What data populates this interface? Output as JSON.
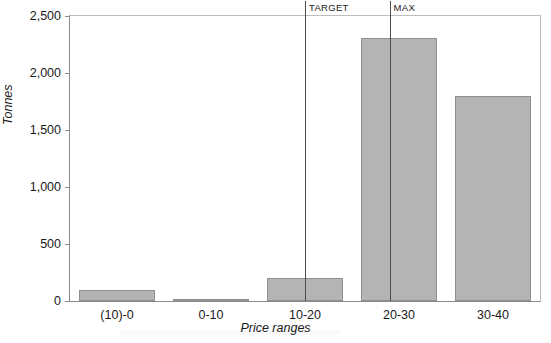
{
  "chart_data": {
    "type": "bar",
    "title": "",
    "xlabel": "Price ranges",
    "ylabel": "Tonnes",
    "categories": [
      "(10)-0",
      "0-10",
      "10-20",
      "20-30",
      "30-40"
    ],
    "values": [
      100,
      20,
      200,
      2310,
      1800
    ],
    "series": [
      {
        "name": "Tonnes",
        "values": [
          100,
          20,
          200,
          2310,
          1800
        ]
      }
    ],
    "ylim": [
      0,
      2500
    ],
    "ytick_values": [
      0,
      500,
      1000,
      1500,
      2000,
      2500
    ],
    "ytick_labels": [
      "0",
      "500",
      "1,000",
      "1,500",
      "2,000",
      "2,500"
    ],
    "grid": false,
    "legend": false,
    "bar_color": "#b4b4b4",
    "bar_edge_color": "#8f8f8f",
    "axis_color": "#8a8a8a",
    "annotations": [
      {
        "label": "TARGET",
        "type": "vertical-line",
        "x_fraction": 0.5,
        "color": "#4d4d4d"
      },
      {
        "label": "MAX",
        "type": "vertical-line",
        "x_fraction": 0.68,
        "color": "#4d4d4d"
      }
    ]
  }
}
